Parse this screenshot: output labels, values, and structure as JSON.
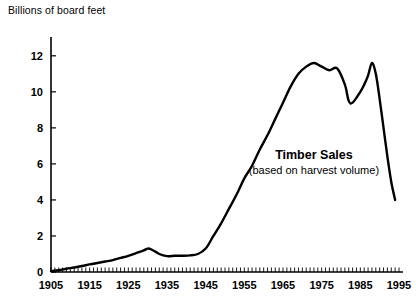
{
  "chart_data": {
    "type": "line",
    "title": "",
    "ylabel": "Billions of board feet",
    "xlabel": "",
    "xlim": [
      1905,
      1995
    ],
    "ylim": [
      0,
      12.6
    ],
    "grid": false,
    "legend": "none",
    "y_ticks": [
      "0",
      "2",
      "4",
      "6",
      "8",
      "10",
      "12"
    ],
    "y_tick_values": [
      0,
      2,
      4,
      6,
      8,
      10,
      12
    ],
    "x_ticks": [
      "1905",
      "1915",
      "1925",
      "1935",
      "1945",
      "1955",
      "1965",
      "1975",
      "1985",
      "1995"
    ],
    "x_tick_values": [
      1905,
      1915,
      1925,
      1935,
      1945,
      1955,
      1965,
      1975,
      1985,
      1995
    ],
    "x_minor_tick_interval": 1,
    "annotations": [
      {
        "name": "series-label",
        "title": "Timber Sales",
        "subtitle": "(based on harvest volume)",
        "x": 1973,
        "y": 6.3
      }
    ],
    "series": [
      {
        "name": "Timber Sales",
        "color": "#000000",
        "x": [
          1905,
          1907,
          1909,
          1911,
          1913,
          1915,
          1917,
          1919,
          1921,
          1923,
          1925,
          1927,
          1929,
          1930,
          1931,
          1933,
          1935,
          1937,
          1939,
          1941,
          1943,
          1945,
          1947,
          1949,
          1951,
          1953,
          1955,
          1957,
          1959,
          1961,
          1963,
          1965,
          1967,
          1969,
          1971,
          1973,
          1975,
          1977,
          1979,
          1981,
          1982,
          1983,
          1985,
          1986,
          1987,
          1988,
          1989,
          1990,
          1991,
          1992,
          1993,
          1994
        ],
        "values": [
          0.05,
          0.1,
          0.18,
          0.25,
          0.33,
          0.42,
          0.5,
          0.58,
          0.66,
          0.78,
          0.9,
          1.05,
          1.2,
          1.3,
          1.25,
          1.0,
          0.88,
          0.9,
          0.9,
          0.92,
          1.0,
          1.3,
          2.0,
          2.7,
          3.5,
          4.3,
          5.2,
          5.9,
          6.8,
          7.6,
          8.5,
          9.4,
          10.3,
          11.0,
          11.4,
          11.6,
          11.4,
          11.2,
          11.3,
          10.4,
          9.5,
          9.4,
          10.0,
          10.4,
          10.9,
          11.6,
          11.0,
          9.6,
          8.0,
          6.4,
          5.0,
          4.0
        ]
      }
    ]
  }
}
